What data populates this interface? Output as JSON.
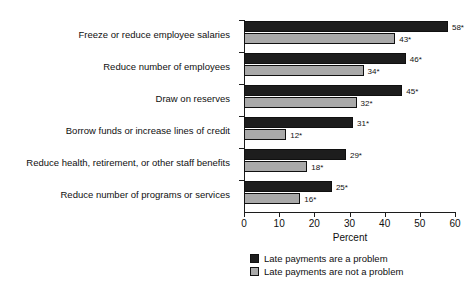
{
  "chart_data": {
    "type": "bar",
    "orientation": "horizontal",
    "title": "",
    "xlabel": "Percent",
    "ylabel": "",
    "xlim": [
      0,
      60
    ],
    "xticks": [
      0,
      10,
      20,
      30,
      40,
      50,
      60
    ],
    "xtick_labels": [
      "0",
      "10",
      "20",
      "30",
      "40",
      "50",
      "60"
    ],
    "grid": false,
    "legend_position": "bottom",
    "value_suffix": "*",
    "categories": [
      "Freeze or reduce employee salaries",
      "Reduce number of employees",
      "Draw on reserves",
      "Borrow funds or increase lines of credit",
      "Reduce health, retirement, or other staff benefits",
      "Reduce number of programs or services"
    ],
    "series": [
      {
        "name": "Late payments are a problem",
        "color": "#1d1d1d",
        "values": [
          58,
          46,
          45,
          31,
          29,
          25
        ],
        "labels": [
          "58*",
          "46*",
          "45*",
          "31*",
          "29*",
          "25*"
        ]
      },
      {
        "name": "Late payments are not a problem",
        "color": "#a9a9a9",
        "values": [
          43,
          34,
          32,
          12,
          18,
          16
        ],
        "labels": [
          "43*",
          "34*",
          "32*",
          "12*",
          "18*",
          "16*"
        ]
      }
    ]
  },
  "axis": {
    "x_title": "Percent",
    "tick_labels": [
      "0",
      "10",
      "20",
      "30",
      "40",
      "50",
      "60"
    ]
  },
  "legend": {
    "items": [
      {
        "label": "Late payments are a problem",
        "swatch": "dark"
      },
      {
        "label": "Late payments are not a problem",
        "swatch": "light"
      }
    ]
  }
}
